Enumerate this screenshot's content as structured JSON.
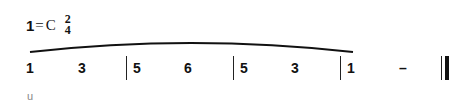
{
  "header": {
    "key_degree": "1",
    "key_equals": "=",
    "key_note": "C",
    "time_signature": {
      "numerator": "2",
      "denominator": "4"
    }
  },
  "score": {
    "notes": [
      {
        "label": "1",
        "x": 26
      },
      {
        "label": "3",
        "x": 78
      },
      {
        "label": "5",
        "x": 133
      },
      {
        "label": "6",
        "x": 184
      },
      {
        "label": "5",
        "x": 240
      },
      {
        "label": "3",
        "x": 291
      },
      {
        "label": "1",
        "x": 347
      },
      {
        "label": "–",
        "x": 399
      }
    ],
    "barlines_x": [
      126,
      233,
      340
    ],
    "final_barline_x": [
      441,
      445
    ],
    "slur": {
      "start_x": 30,
      "end_x": 353,
      "y_ends": 52,
      "y_peak": 43
    }
  },
  "lyrics": {
    "text": "u"
  }
}
